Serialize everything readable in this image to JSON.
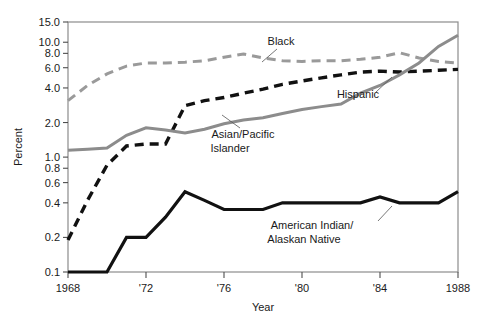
{
  "chart_data": {
    "type": "line",
    "title": "",
    "xlabel": "Year",
    "ylabel": "Percent",
    "yscale": "log",
    "ylim": [
      0.1,
      15.0
    ],
    "xlim": [
      1968,
      1988
    ],
    "grid": false,
    "legend_position": "inline-annotations",
    "y_ticks": [
      {
        "value": 15.0,
        "label": "15.0"
      },
      {
        "value": 10.0,
        "label": "10.0"
      },
      {
        "value": 8.0,
        "label": "8.0"
      },
      {
        "value": 6.0,
        "label": "6.0"
      },
      {
        "value": 4.0,
        "label": "4.0"
      },
      {
        "value": 2.0,
        "label": "2.0"
      },
      {
        "value": 1.0,
        "label": "1.0"
      },
      {
        "value": 0.8,
        "label": "0.8"
      },
      {
        "value": 0.6,
        "label": "0.6"
      },
      {
        "value": 0.4,
        "label": "0.4"
      },
      {
        "value": 0.2,
        "label": "0.2"
      },
      {
        "value": 0.1,
        "label": "0.1"
      }
    ],
    "x_ticks": [
      {
        "value": 1968,
        "label": "1968"
      },
      {
        "value": 1972,
        "label": "'72"
      },
      {
        "value": 1976,
        "label": "'76"
      },
      {
        "value": 1980,
        "label": "'80"
      },
      {
        "value": 1984,
        "label": "'84"
      },
      {
        "value": 1988,
        "label": "1988"
      }
    ],
    "x": [
      1968,
      1969,
      1970,
      1971,
      1972,
      1973,
      1974,
      1975,
      1976,
      1977,
      1978,
      1979,
      1980,
      1981,
      1982,
      1983,
      1984,
      1985,
      1986,
      1987,
      1988
    ],
    "series": [
      {
        "name": "Black",
        "color": "#9a9a9a",
        "style": "dashed",
        "width": 3.0,
        "label": "Black",
        "label_x": 281,
        "label_y": 45,
        "values": [
          3.1,
          4.2,
          5.3,
          6.2,
          6.6,
          6.6,
          6.7,
          6.9,
          7.4,
          7.9,
          7.3,
          6.9,
          6.8,
          6.9,
          6.9,
          7.1,
          7.4,
          8.1,
          7.3,
          6.8,
          6.6
        ]
      },
      {
        "name": "Hispanic",
        "color": "#111111",
        "style": "dashed",
        "width": 3.4,
        "label": "Hispanic",
        "label_x": 358,
        "label_y": 98,
        "values": [
          0.19,
          0.42,
          0.85,
          1.25,
          1.3,
          1.3,
          2.8,
          3.1,
          3.3,
          3.6,
          3.9,
          4.3,
          4.6,
          4.9,
          5.2,
          5.5,
          5.6,
          5.5,
          5.6,
          5.7,
          5.8
        ]
      },
      {
        "name": "Asian/Pacific Islander",
        "color": "#8c8c8c",
        "style": "solid",
        "width": 3.0,
        "label": "Asian/Pacific",
        "label2": "Islander",
        "label_x": 243,
        "label_y": 138,
        "values": [
          1.15,
          1.17,
          1.2,
          1.55,
          1.8,
          1.72,
          1.62,
          1.75,
          1.95,
          2.1,
          2.2,
          2.4,
          2.6,
          2.75,
          2.9,
          3.6,
          4.2,
          5.2,
          6.6,
          9.2,
          11.5
        ]
      },
      {
        "name": "American Indian/Alaskan Native",
        "color": "#111111",
        "style": "solid",
        "width": 3.2,
        "label": "American Indian/",
        "label2": "Alaskan Native",
        "label_x": 312,
        "label_y": 229,
        "values": [
          0.1,
          0.1,
          0.1,
          0.2,
          0.2,
          0.3,
          0.5,
          0.42,
          0.35,
          0.35,
          0.35,
          0.4,
          0.4,
          0.4,
          0.4,
          0.4,
          0.45,
          0.4,
          0.4,
          0.4,
          0.5
        ]
      }
    ]
  },
  "axes": {
    "ylabel": "Percent",
    "xlabel": "Year"
  }
}
